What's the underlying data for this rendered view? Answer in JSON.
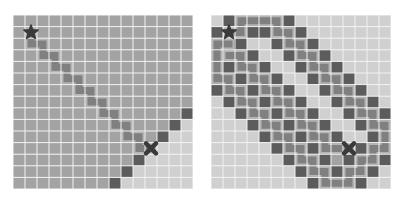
{
  "grid": {
    "cols": 15,
    "rows": 15,
    "cell_w": 12,
    "cell_h": 11.6
  },
  "colors": {
    "grid_line": "#f2f2f2",
    "region_dark_bg": "#a3a3a3",
    "region_light_bg": "#d0d0d0",
    "wall": "#5c5c5c",
    "path": "#808080",
    "path_edge": "#b5b5b5",
    "marker": "#3a3a3a"
  },
  "panels": [
    {
      "name": "left-maze",
      "x": 13,
      "start": {
        "col": 1,
        "row": 1,
        "icon": "star-icon"
      },
      "goal": {
        "col": 11,
        "row": 11,
        "icon": "x-icon"
      },
      "background_rule": "diagonal",
      "walls": [
        [
          14,
          8
        ],
        [
          13,
          9
        ],
        [
          12,
          10
        ],
        [
          10,
          12
        ],
        [
          9,
          13
        ],
        [
          8,
          14
        ]
      ],
      "path": [
        [
          1,
          1
        ],
        [
          1,
          2
        ],
        [
          2,
          2
        ],
        [
          2,
          3
        ],
        [
          3,
          3
        ],
        [
          3,
          4
        ],
        [
          4,
          4
        ],
        [
          4,
          5
        ],
        [
          5,
          5
        ],
        [
          5,
          6
        ],
        [
          6,
          6
        ],
        [
          6,
          7
        ],
        [
          7,
          7
        ],
        [
          7,
          8
        ],
        [
          8,
          8
        ],
        [
          8,
          9
        ],
        [
          9,
          9
        ],
        [
          9,
          10
        ],
        [
          10,
          10
        ],
        [
          10,
          11
        ],
        [
          11,
          11
        ]
      ]
    },
    {
      "name": "right-maze",
      "x": 211,
      "start": {
        "col": 1,
        "row": 1,
        "icon": "star-icon"
      },
      "goal": {
        "col": 11,
        "row": 11,
        "icon": "x-icon"
      },
      "background_rule": "light",
      "walls": [
        [
          1,
          0
        ],
        [
          6,
          0
        ],
        [
          0,
          1
        ],
        [
          3,
          1
        ],
        [
          4,
          1
        ],
        [
          7,
          1
        ],
        [
          1,
          2
        ],
        [
          2,
          2
        ],
        [
          5,
          2
        ],
        [
          8,
          2
        ],
        [
          3,
          3
        ],
        [
          6,
          3
        ],
        [
          9,
          3
        ],
        [
          1,
          4
        ],
        [
          4,
          4
        ],
        [
          7,
          4
        ],
        [
          10,
          4
        ],
        [
          2,
          5
        ],
        [
          5,
          5
        ],
        [
          8,
          5
        ],
        [
          11,
          5
        ],
        [
          0,
          6
        ],
        [
          3,
          6
        ],
        [
          6,
          6
        ],
        [
          9,
          6
        ],
        [
          12,
          6
        ],
        [
          1,
          7
        ],
        [
          4,
          7
        ],
        [
          7,
          7
        ],
        [
          10,
          7
        ],
        [
          13,
          7
        ],
        [
          2,
          8
        ],
        [
          5,
          8
        ],
        [
          8,
          8
        ],
        [
          11,
          8
        ],
        [
          14,
          8
        ],
        [
          3,
          9
        ],
        [
          6,
          9
        ],
        [
          9,
          9
        ],
        [
          12,
          9
        ],
        [
          4,
          10
        ],
        [
          7,
          10
        ],
        [
          10,
          10
        ],
        [
          13,
          10
        ],
        [
          5,
          11
        ],
        [
          8,
          11
        ],
        [
          12,
          11
        ],
        [
          6,
          12
        ],
        [
          9,
          12
        ],
        [
          11,
          12
        ],
        [
          14,
          12
        ],
        [
          7,
          13
        ],
        [
          10,
          13
        ],
        [
          13,
          13
        ],
        [
          8,
          14
        ],
        [
          12,
          14
        ]
      ],
      "medium_cells": [
        [
          0,
          2
        ],
        [
          0,
          3
        ],
        [
          0,
          4
        ],
        [
          0,
          5
        ],
        [
          1,
          3
        ],
        [
          2,
          3
        ],
        [
          1,
          5
        ],
        [
          1,
          6
        ],
        [
          2,
          4
        ],
        [
          2,
          6
        ],
        [
          2,
          7
        ],
        [
          3,
          4
        ],
        [
          3,
          5
        ],
        [
          3,
          7
        ],
        [
          3,
          8
        ],
        [
          4,
          5
        ],
        [
          4,
          6
        ],
        [
          4,
          8
        ],
        [
          4,
          9
        ],
        [
          5,
          6
        ],
        [
          5,
          7
        ],
        [
          5,
          9
        ],
        [
          5,
          10
        ],
        [
          6,
          7
        ],
        [
          6,
          8
        ],
        [
          6,
          10
        ],
        [
          6,
          11
        ],
        [
          7,
          8
        ],
        [
          7,
          9
        ],
        [
          7,
          11
        ],
        [
          7,
          12
        ],
        [
          8,
          9
        ],
        [
          8,
          10
        ],
        [
          8,
          12
        ],
        [
          8,
          13
        ],
        [
          9,
          10
        ],
        [
          9,
          11
        ],
        [
          9,
          13
        ],
        [
          9,
          14
        ],
        [
          10,
          11
        ],
        [
          10,
          12
        ],
        [
          10,
          14
        ],
        [
          11,
          13
        ],
        [
          11,
          14
        ],
        [
          12,
          12
        ],
        [
          12,
          13
        ],
        [
          13,
          11
        ],
        [
          13,
          12
        ],
        [
          14,
          9
        ],
        [
          14,
          10
        ],
        [
          14,
          11
        ],
        [
          13,
          8
        ],
        [
          13,
          9
        ],
        [
          12,
          7
        ],
        [
          12,
          8
        ],
        [
          11,
          6
        ],
        [
          11,
          7
        ],
        [
          10,
          5
        ],
        [
          10,
          6
        ],
        [
          9,
          4
        ],
        [
          9,
          5
        ],
        [
          8,
          3
        ],
        [
          8,
          4
        ],
        [
          7,
          2
        ],
        [
          7,
          3
        ],
        [
          6,
          1
        ],
        [
          6,
          2
        ],
        [
          5,
          0
        ],
        [
          5,
          1
        ],
        [
          4,
          0
        ],
        [
          3,
          0
        ],
        [
          2,
          0
        ],
        [
          2,
          1
        ]
      ],
      "paths": [
        [
          [
            1,
            1
          ],
          [
            2,
            1
          ],
          [
            2,
            0
          ],
          [
            3,
            0
          ],
          [
            4,
            0
          ],
          [
            5,
            0
          ],
          [
            5,
            1
          ],
          [
            6,
            1
          ],
          [
            6,
            2
          ],
          [
            7,
            2
          ],
          [
            7,
            3
          ],
          [
            8,
            3
          ],
          [
            8,
            4
          ],
          [
            9,
            4
          ],
          [
            9,
            5
          ],
          [
            10,
            5
          ],
          [
            10,
            6
          ],
          [
            11,
            6
          ],
          [
            11,
            7
          ],
          [
            12,
            7
          ],
          [
            12,
            8
          ],
          [
            13,
            8
          ],
          [
            13,
            9
          ],
          [
            14,
            9
          ],
          [
            14,
            10
          ],
          [
            14,
            11
          ],
          [
            13,
            11
          ],
          [
            13,
            12
          ],
          [
            12,
            12
          ],
          [
            12,
            13
          ],
          [
            11,
            13
          ],
          [
            11,
            14
          ],
          [
            10,
            14
          ],
          [
            9,
            14
          ],
          [
            9,
            13
          ],
          [
            8,
            13
          ],
          [
            8,
            12
          ],
          [
            7,
            12
          ],
          [
            7,
            11
          ],
          [
            6,
            11
          ],
          [
            6,
            10
          ],
          [
            5,
            10
          ],
          [
            5,
            9
          ],
          [
            4,
            9
          ],
          [
            4,
            8
          ],
          [
            3,
            8
          ],
          [
            3,
            7
          ],
          [
            2,
            7
          ],
          [
            2,
            6
          ],
          [
            1,
            6
          ],
          [
            1,
            5
          ],
          [
            0,
            5
          ],
          [
            0,
            4
          ],
          [
            0,
            3
          ],
          [
            0,
            2
          ],
          [
            1,
            2
          ]
        ],
        [
          [
            1,
            3
          ],
          [
            2,
            3
          ],
          [
            2,
            4
          ],
          [
            3,
            4
          ],
          [
            3,
            5
          ],
          [
            4,
            5
          ],
          [
            4,
            6
          ],
          [
            5,
            6
          ],
          [
            5,
            7
          ],
          [
            6,
            7
          ],
          [
            6,
            8
          ],
          [
            7,
            8
          ],
          [
            7,
            9
          ],
          [
            8,
            9
          ],
          [
            8,
            10
          ],
          [
            9,
            10
          ],
          [
            9,
            11
          ],
          [
            10,
            11
          ],
          [
            11,
            11
          ]
        ]
      ]
    }
  ]
}
